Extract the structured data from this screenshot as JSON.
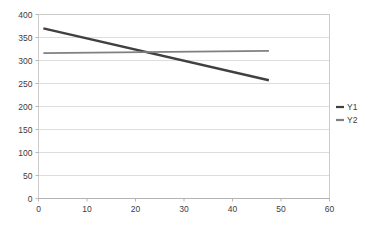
{
  "chart_data": {
    "type": "line",
    "title": "",
    "subtitle": "",
    "xlabel": "",
    "ylabel": "",
    "xlim": [
      0,
      60
    ],
    "ylim": [
      0,
      400
    ],
    "x_ticks": [
      0,
      10,
      20,
      30,
      40,
      50,
      60
    ],
    "y_ticks": [
      0,
      50,
      100,
      150,
      200,
      250,
      300,
      350,
      400
    ],
    "x_tick_labels": [
      "0",
      "10",
      "20",
      "30",
      "40",
      "50",
      "60"
    ],
    "y_tick_labels": [
      "0",
      "50",
      "100",
      "150",
      "200",
      "250",
      "300",
      "350",
      "400"
    ],
    "grid": {
      "horizontal": true,
      "vertical": false
    },
    "legend": {
      "position": "right",
      "entries": [
        "Y1",
        "Y2"
      ]
    },
    "series": [
      {
        "name": "Y1",
        "color": "#404040",
        "width": 2.4,
        "x": [
          1,
          47.5
        ],
        "values": [
          370,
          257
        ]
      },
      {
        "name": "Y2",
        "color": "#808080",
        "width": 1.9,
        "x": [
          1,
          47.5
        ],
        "values": [
          316,
          321
        ]
      }
    ],
    "annotations": []
  },
  "legend": {
    "items": [
      {
        "label": "Y1",
        "color": "#404040"
      },
      {
        "label": "Y2",
        "color": "#808080"
      }
    ]
  },
  "colors": {
    "background": "#ffffff",
    "gridline": "#d4d4d4",
    "plot_border": "#c8c8c8",
    "axis": "#b0b0b0",
    "text": "#3c3c3c",
    "series_y1": "#404040",
    "series_y2": "#808080"
  }
}
